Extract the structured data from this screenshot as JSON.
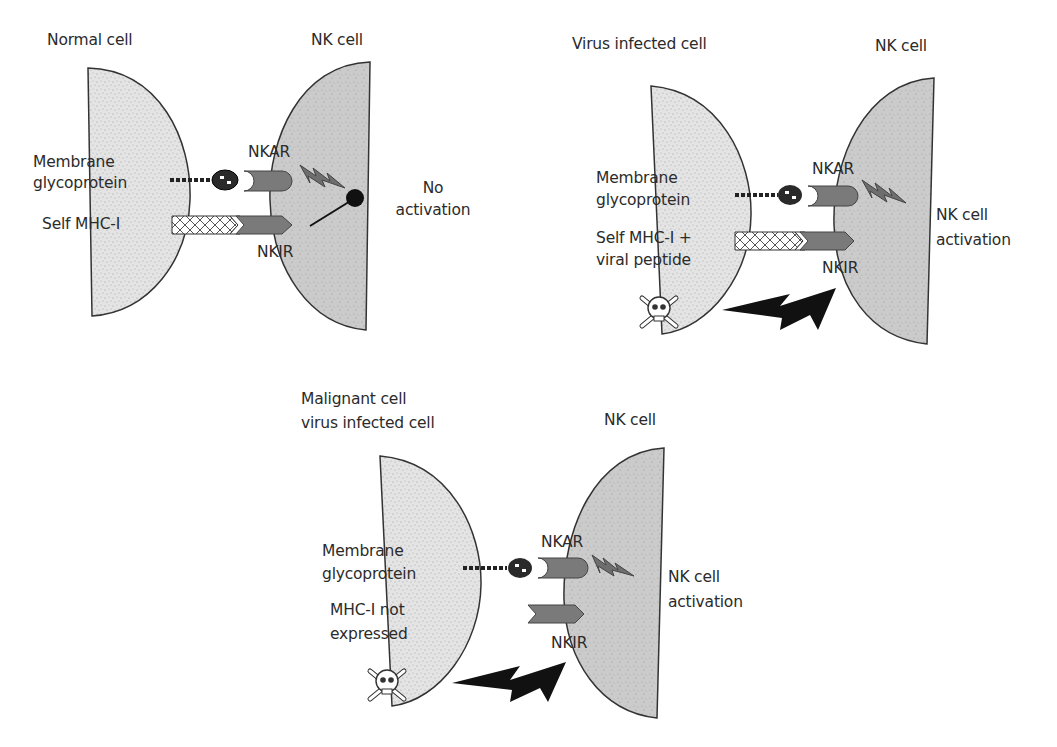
{
  "panels": [
    {
      "id": "normal",
      "target_title": "Normal cell",
      "nk_title": "NK cell",
      "ligand1_label": [
        "Membrane",
        "glycoprotein"
      ],
      "ligand2_label": "Self MHC-I",
      "activating_receptor": "NKAR",
      "inhibitory_receptor": "NKIR",
      "outcome": [
        "No",
        "activation"
      ]
    },
    {
      "id": "virus",
      "target_title": "Virus infected cell",
      "nk_title": "NK cell",
      "ligand1_label": [
        "Membrane",
        "glycoprotein"
      ],
      "ligand2_label": [
        "Self MHC-I +",
        "viral peptide"
      ],
      "activating_receptor": "NKAR",
      "inhibitory_receptor": "NKIR",
      "outcome": [
        "NK cell",
        "activation"
      ]
    },
    {
      "id": "malignant",
      "target_title": [
        "Malignant cell",
        "virus infected cell"
      ],
      "nk_title": "NK cell",
      "ligand1_label": [
        "Membrane",
        "glycoprotein"
      ],
      "ligand2_label": [
        "MHC-I not",
        "expressed"
      ],
      "activating_receptor": "NKAR",
      "inhibitory_receptor": "NKIR",
      "outcome": [
        "NK cell",
        "activation"
      ]
    }
  ],
  "colors": {
    "target_cell_fill": "#e9e9e9",
    "nk_cell_fill": "#cfcfcf",
    "receptor_fill": "#7a7a7a",
    "signal_small": "#6e6e6e",
    "killing_bolt": "#111111",
    "outline": "#333333"
  }
}
